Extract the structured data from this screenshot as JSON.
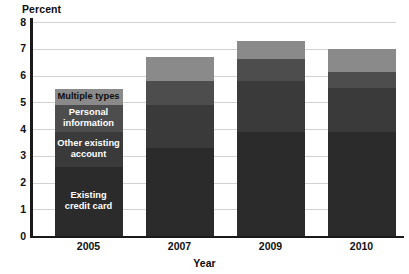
{
  "chart_data": {
    "type": "bar",
    "stacked": true,
    "title": "",
    "xlabel": "Year",
    "ylabel": "Percent",
    "categories": [
      "2005",
      "2007",
      "2009",
      "2010"
    ],
    "ylim": [
      0,
      8
    ],
    "yticks": [
      "0",
      "1",
      "2",
      "3",
      "4",
      "5",
      "6",
      "7",
      "8"
    ],
    "grid": true,
    "legend_position": "inside-first-bar",
    "series": [
      {
        "name": "Existing credit card",
        "label": "Existing\ncredit card",
        "color": "#2b2b2b",
        "text_color": "#ffffff",
        "values": [
          2.6,
          3.3,
          3.9,
          3.9
        ]
      },
      {
        "name": "Other existing account",
        "label": "Other existing\naccount",
        "color": "#3a3a3a",
        "text_color": "#ffffff",
        "values": [
          1.3,
          1.6,
          1.9,
          1.65
        ]
      },
      {
        "name": "Personal information",
        "label": "Personal\ninformation",
        "color": "#4d4d4d",
        "text_color": "#ffffff",
        "values": [
          1.0,
          0.9,
          0.8,
          0.6
        ]
      },
      {
        "name": "Multiple types",
        "label": "Multiple types",
        "color": "#8a8a8a",
        "text_color": "#0d0d0d",
        "values": [
          0.6,
          0.9,
          0.7,
          0.85
        ]
      }
    ],
    "totals": [
      5.5,
      6.7,
      7.3,
      7.0
    ]
  },
  "legend_labels": {
    "multiple_types": "Multiple types",
    "personal_information_line1": "Personal",
    "personal_information_line2": "information",
    "other_existing_line1": "Other existing",
    "other_existing_line2": "account",
    "existing_credit_line1": "Existing",
    "existing_credit_line2": "credit card"
  },
  "axes": {
    "y_title": "Percent",
    "x_title": "Year"
  },
  "colors": {
    "grid": "#d2d2d2",
    "axis": "#1a1a1a",
    "background": "#ffffff"
  }
}
